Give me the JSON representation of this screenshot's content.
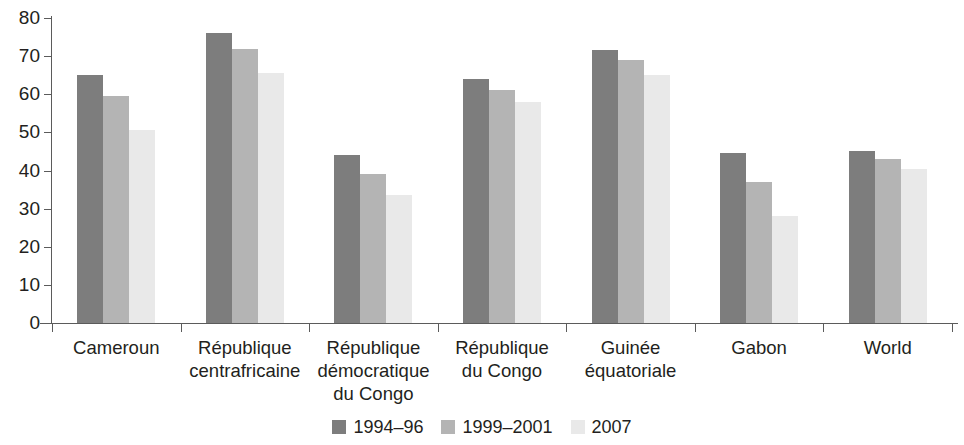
{
  "chart_data": {
    "type": "bar",
    "title": "",
    "subtitle": "",
    "xlabel": "",
    "ylabel": "",
    "ylim": [
      0,
      80
    ],
    "yticks": [
      0,
      10,
      20,
      30,
      40,
      50,
      60,
      70,
      80
    ],
    "ytick_labels": [
      "0",
      "10",
      "20",
      "30",
      "40",
      "50",
      "60",
      "70",
      "80"
    ],
    "grid": false,
    "legend_position": "bottom-center",
    "categories": [
      "Cameroun",
      "République centrafricaine",
      "République démocratique du Congo",
      "République du Congo",
      "Guinée équatoriale",
      "Gabon",
      "World"
    ],
    "category_lines": [
      [
        "Cameroun"
      ],
      [
        "République",
        "centrafricaine"
      ],
      [
        "République",
        "démocratique",
        "du Congo"
      ],
      [
        "République",
        "du Congo"
      ],
      [
        "Guinée",
        "équatoriale"
      ],
      [
        "Gabon"
      ],
      [
        "World"
      ]
    ],
    "series": [
      {
        "name": "1994–96",
        "color": "#7d7d7d",
        "values": [
          65,
          76,
          44,
          64,
          71.5,
          44.5,
          45
        ]
      },
      {
        "name": "1999–2001",
        "color": "#b4b4b4",
        "values": [
          59.5,
          72,
          39,
          61,
          69,
          37,
          43
        ]
      },
      {
        "name": "2007",
        "color": "#e9e9e9",
        "values": [
          50.5,
          65.5,
          33.5,
          58,
          65,
          28,
          40.5
        ]
      }
    ]
  },
  "axis": {
    "line_color": "#5b5b5b"
  }
}
